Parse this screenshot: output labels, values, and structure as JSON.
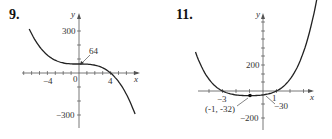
{
  "problems": [
    {
      "number": "9."
    },
    {
      "number": "11."
    }
  ],
  "chart_data": [
    {
      "type": "line",
      "title": "9.",
      "xlabel": "x",
      "ylabel": "y",
      "function": "y = -x^3 + 64",
      "xlim": [
        -6.3,
        7.1
      ],
      "ylim": [
        -300,
        300
      ],
      "x_tick_labels": [
        "-4",
        "0",
        "4"
      ],
      "y_tick_labels": [
        "300",
        "-300"
      ],
      "x": [
        -6.3,
        -5,
        -4,
        -3,
        -2,
        -1,
        0,
        1,
        2,
        3,
        4,
        5,
        6,
        7.1
      ],
      "values": [
        314,
        189,
        128,
        91,
        72,
        65,
        64,
        63,
        56,
        37,
        0,
        -61,
        -152,
        -294
      ],
      "annotations": [
        {
          "text": "64",
          "x": 0,
          "y": 64
        }
      ],
      "grid": false
    },
    {
      "type": "line",
      "title": "11.",
      "xlabel": "x",
      "ylabel": "y",
      "function": "quartic with roots at x=-3 and x=1",
      "xlim": [
        -5,
        4
      ],
      "ylim": [
        -200,
        500
      ],
      "x_tick_labels": [
        "-3",
        "1"
      ],
      "y_tick_labels": [
        "200",
        "-200"
      ],
      "x": [
        -5,
        -4.5,
        -4,
        -3.5,
        -3,
        -2,
        -1,
        0,
        1,
        1.5,
        2,
        2.5,
        3
      ],
      "values": [
        500,
        300,
        135,
        55,
        0,
        -30,
        -32,
        -30,
        0,
        45,
        130,
        280,
        500
      ],
      "annotations": [
        {
          "text": "(-1, -32)",
          "x": -1,
          "y": -32
        },
        {
          "text": "-30",
          "x": 0,
          "y": -30
        }
      ],
      "grid": false
    }
  ]
}
